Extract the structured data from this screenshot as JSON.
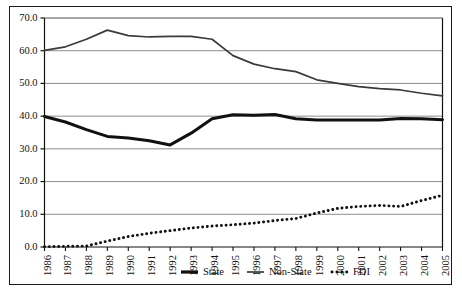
{
  "chart_data": {
    "type": "line",
    "title": "",
    "subtitle": "",
    "xlabel": "",
    "ylabel": "",
    "ylim": [
      0.0,
      70.0
    ],
    "ytick_labels": [
      "0.0",
      "10.0",
      "20.0",
      "30.0",
      "40.0",
      "50.0",
      "60.0",
      "70.0"
    ],
    "ytick_values": [
      0.0,
      10.0,
      20.0,
      30.0,
      40.0,
      50.0,
      60.0,
      70.0
    ],
    "grid": "horizontal",
    "legend_position": "bottom",
    "categories": [
      "1986",
      "1987",
      "1988",
      "1989",
      "1990",
      "1991",
      "1992",
      "1993",
      "1994",
      "1995",
      "1996",
      "1997",
      "1998",
      "1999",
      "2000",
      "2001",
      "2002",
      "2003",
      "2004",
      "2005"
    ],
    "series": [
      {
        "name": "State",
        "style": "thick-solid",
        "color": "#111111",
        "values": [
          39.9,
          38.2,
          35.9,
          33.8,
          33.3,
          32.5,
          31.2,
          34.8,
          39.2,
          40.4,
          40.3,
          40.5,
          39.2,
          38.8,
          38.8,
          38.8,
          38.8,
          39.3,
          39.2,
          38.9
        ]
      },
      {
        "name": "Non-State",
        "style": "thin-solid",
        "color": "#3a3a3a",
        "values": [
          60.1,
          61.2,
          63.5,
          66.3,
          64.6,
          64.2,
          64.4,
          64.4,
          63.5,
          58.5,
          55.9,
          54.5,
          53.6,
          51.1,
          50.0,
          49.0,
          48.4,
          48.0,
          47.0,
          46.2
        ]
      },
      {
        "name": "FDI",
        "style": "dotted",
        "color": "#111111",
        "values": [
          0.1,
          0.2,
          0.3,
          1.8,
          3.2,
          4.2,
          5.0,
          5.8,
          6.4,
          6.8,
          7.3,
          8.1,
          8.7,
          10.4,
          11.8,
          12.4,
          12.7,
          12.4,
          14.2,
          15.8
        ]
      }
    ],
    "legend": [
      {
        "label": "State",
        "style": "thick-solid"
      },
      {
        "label": "Non-State",
        "style": "thin-solid"
      },
      {
        "label": "FDI",
        "style": "dotted"
      }
    ]
  }
}
